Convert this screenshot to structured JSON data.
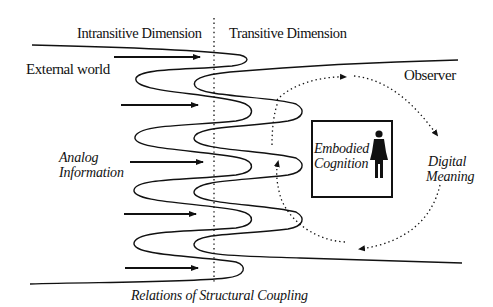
{
  "diagram": {
    "labels": {
      "intransitive_dimension": "Intransitive Dimension",
      "transitive_dimension": "Transitive Dimension",
      "external_world": "External world",
      "observer": "Observer",
      "analog_information_line1": "Analog",
      "analog_information_line2": "Information",
      "embodied_cognition_line1": "Embodied",
      "embodied_cognition_line2": "Cognition",
      "digital_meaning_line1": "Digital",
      "digital_meaning_line2": "Meaning",
      "caption": "Relations of Structural Coupling"
    },
    "elements": {
      "divider": "dotted vertical line separating intransitive and transitive dimensions",
      "input_arrows": 5,
      "coupling_curves": 2,
      "cycle": "dotted circular arrows around embodied cognition box",
      "person_icon": "human-figure-icon"
    },
    "colors": {
      "ink": "#111111",
      "background": "#ffffff"
    }
  }
}
